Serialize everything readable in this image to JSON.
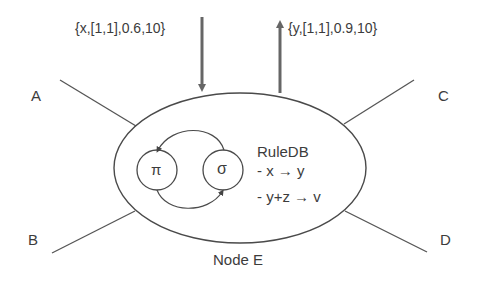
{
  "diagram": {
    "title": "Node E",
    "node_label": "Node E",
    "neighbors": [
      {
        "id": "A",
        "label": "A"
      },
      {
        "id": "B",
        "label": "B"
      },
      {
        "id": "C",
        "label": "C"
      },
      {
        "id": "D",
        "label": "D"
      }
    ],
    "incoming_message": "{x,[1,1],0.6,10}",
    "outgoing_message": "{y,[1,1],0.9,10}",
    "inner_nodes": [
      {
        "id": "pi",
        "symbol": "π"
      },
      {
        "id": "sigma",
        "symbol": "σ"
      }
    ],
    "rule_db": {
      "title": "RuleDB",
      "rules": [
        "- x → y",
        "- y+z → v"
      ]
    },
    "colors": {
      "stroke": "#4a4a4a",
      "arrow": "#6a6a6a",
      "text": "#3c3c3c",
      "background": "#ffffff"
    }
  }
}
